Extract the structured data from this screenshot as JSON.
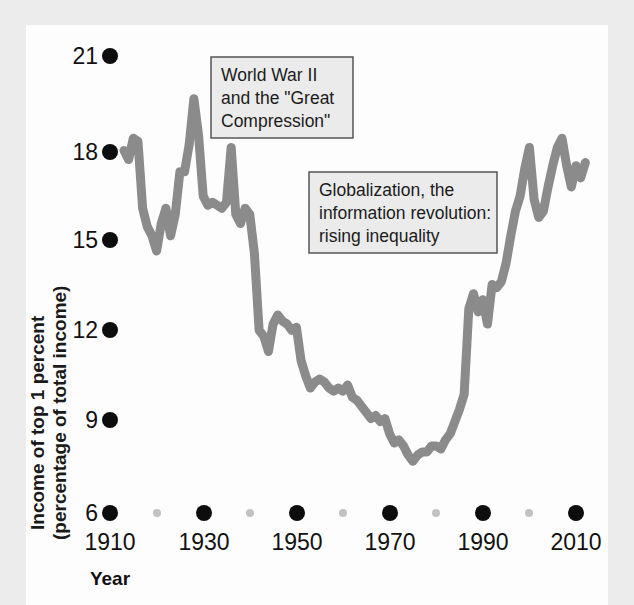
{
  "figure": {
    "background_color": "#ececec",
    "paper_color": "#fdfdfd",
    "line_color": "#8b8b8b",
    "tick_color": "#0d0d0d",
    "minor_tick_color": "#c2c2c2"
  },
  "axes": {
    "y_title_line1": "Income of top 1 percent",
    "y_title_line2": "(percentage of total income)",
    "x_title": "Year"
  },
  "annotations": [
    {
      "id": "wwii-great-compression",
      "lines": [
        "World War II",
        "and the \"Great",
        "Compression\""
      ]
    },
    {
      "id": "globalization-rising-inequality",
      "lines": [
        "Globalization, the",
        "information revolution:",
        "rising inequality"
      ]
    }
  ],
  "chart_data": {
    "type": "line",
    "title": "",
    "xlabel": "Year",
    "ylabel": "Income of top 1 percent (percentage of total income)",
    "xlim": [
      1910,
      2014
    ],
    "ylim": [
      6,
      21
    ],
    "grid": false,
    "legend": "none",
    "yticks": [
      6,
      9,
      12,
      15,
      18,
      21
    ],
    "ytick_labels": [
      "6",
      "9",
      "12",
      "15",
      "18",
      "21"
    ],
    "xticks": [
      1910,
      1930,
      1950,
      1970,
      1990,
      2010
    ],
    "xtick_labels": [
      "1910",
      "1930",
      "1950",
      "1970",
      "1990",
      "2010"
    ],
    "x_minor_ticks": [
      1920,
      1940,
      1960,
      1980,
      2000
    ],
    "series": [
      {
        "name": "Income share of top 1 percent",
        "x": [
          1913,
          1914,
          1915,
          1916,
          1917,
          1918,
          1919,
          1920,
          1921,
          1922,
          1923,
          1924,
          1925,
          1926,
          1927,
          1928,
          1929,
          1930,
          1931,
          1932,
          1933,
          1934,
          1935,
          1936,
          1937,
          1938,
          1939,
          1940,
          1941,
          1942,
          1943,
          1944,
          1945,
          1946,
          1947,
          1948,
          1949,
          1950,
          1951,
          1952,
          1953,
          1954,
          1955,
          1956,
          1957,
          1958,
          1959,
          1960,
          1961,
          1962,
          1963,
          1964,
          1965,
          1966,
          1967,
          1968,
          1969,
          1970,
          1971,
          1972,
          1973,
          1974,
          1975,
          1976,
          1977,
          1978,
          1979,
          1980,
          1981,
          1982,
          1983,
          1984,
          1985,
          1986,
          1987,
          1988,
          1989,
          1990,
          1991,
          1992,
          1993,
          1994,
          1995,
          1996,
          1997,
          1998,
          1999,
          2000,
          2001,
          2002,
          2003,
          2004,
          2005,
          2006,
          2007,
          2008,
          2009,
          2010,
          2011,
          2012
        ],
        "values": [
          17.9,
          17.6,
          18.3,
          18.2,
          16.0,
          15.4,
          15.1,
          14.6,
          15.5,
          16.0,
          15.1,
          15.8,
          17.2,
          17.2,
          18.1,
          19.6,
          18.4,
          16.4,
          16.1,
          16.2,
          16.1,
          16.0,
          16.2,
          18.0,
          15.8,
          15.5,
          16.0,
          15.8,
          14.5,
          12.0,
          11.8,
          11.3,
          12.2,
          12.5,
          12.3,
          12.2,
          12.0,
          12.1,
          11.0,
          10.5,
          10.1,
          10.3,
          10.4,
          10.3,
          10.1,
          10.0,
          10.1,
          10.0,
          10.2,
          9.8,
          9.7,
          9.5,
          9.3,
          9.1,
          9.2,
          9.0,
          9.1,
          8.6,
          8.3,
          8.4,
          8.2,
          7.9,
          7.7,
          7.9,
          8.0,
          8.0,
          8.2,
          8.2,
          8.1,
          8.4,
          8.6,
          9.0,
          9.4,
          9.9,
          12.7,
          13.2,
          12.6,
          13.0,
          12.2,
          13.5,
          13.4,
          13.6,
          14.2,
          15.1,
          15.9,
          16.4,
          17.3,
          18.0,
          16.3,
          15.7,
          15.9,
          16.7,
          17.4,
          18.0,
          18.3,
          17.4,
          16.7,
          17.4,
          17.0,
          17.5
        ]
      }
    ]
  }
}
